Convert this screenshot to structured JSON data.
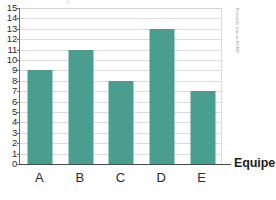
{
  "chart_data": {
    "type": "bar",
    "title": "",
    "categories": [
      "A",
      "B",
      "C",
      "D",
      "E"
    ],
    "values": [
      9,
      11,
      8,
      13,
      7
    ],
    "series": [
      {
        "name": "",
        "values": [
          9,
          11,
          8,
          13,
          7
        ]
      }
    ],
    "xlabel": "Equipe",
    "ylabel": "",
    "ylim": [
      0,
      15
    ],
    "ytick_step": 1,
    "yticks": [
      0,
      1,
      2,
      3,
      4,
      5,
      6,
      7,
      8,
      9,
      10,
      11,
      12,
      13,
      14,
      15
    ],
    "ytick_labels": [
      "0",
      "1",
      "2",
      "3",
      "4",
      "5",
      "6",
      "7",
      "8",
      "9",
      "10",
      "11",
      "12",
      "13",
      "14",
      "15"
    ],
    "grid": true,
    "grid_axis": "y",
    "legend": false,
    "legend_position": "none",
    "bar_color": "#4a9e8f",
    "grid_color": "#dcdcdc",
    "axis_color": "#4a4a4a",
    "text_color": "#2b2b2b",
    "annotations": []
  },
  "credit": {
    "text": "Ronaldo Inacio/ID/BR"
  }
}
